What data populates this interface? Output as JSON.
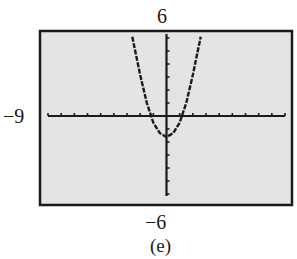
{
  "chart_data": {
    "type": "line",
    "title": "",
    "caption": "(e)",
    "function": "parabola (y = a·x² + c), vertex below origin",
    "window": {
      "xmin": -9,
      "xmax": 9,
      "ymin": -6,
      "ymax": 6,
      "xscl": 1,
      "yscl": 1
    },
    "labels": {
      "ymax": "6",
      "xmin": "−9",
      "ymin": "−6"
    },
    "xlabel": "",
    "ylabel": "",
    "xlim": [
      -9,
      9
    ],
    "ylim": [
      -6,
      6
    ],
    "grid": false,
    "series": [
      {
        "name": "curve",
        "x": [
          -2.6,
          -2,
          -1.5,
          -1,
          -0.5,
          0,
          0.5,
          1,
          1.5,
          2,
          2.6
        ],
        "y": [
          6.0,
          3.1,
          1.0,
          -0.5,
          -1.3,
          -1.6,
          -1.3,
          -0.5,
          1.0,
          3.1,
          6.0
        ]
      }
    ],
    "vertex": [
      0,
      -1.6
    ],
    "x_intercepts": [
      -1.3,
      1.3
    ]
  },
  "colors": {
    "screen_bg": "#e4e4e4",
    "frame": "#1a1a1a",
    "curve": "#1a1a1a"
  }
}
